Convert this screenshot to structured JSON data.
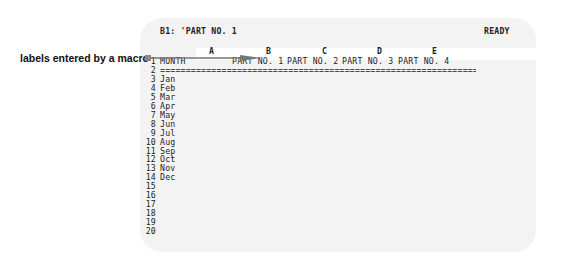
{
  "screen": {
    "cell_address": "B1: 'PART NO. 1",
    "mode_indicator": "READY"
  },
  "columns": [
    "A",
    "B",
    "C",
    "D",
    "E"
  ],
  "rows": [
    {
      "num": "1",
      "A": "MONTH",
      "B": "PART NO. 1",
      "C": "PART NO. 2",
      "D": "PART NO. 3",
      "E": "PART NO. 4"
    },
    {
      "num": "2",
      "A": "==========================================================================="
    },
    {
      "num": "3",
      "A": "Jan"
    },
    {
      "num": "4",
      "A": "Feb"
    },
    {
      "num": "5",
      "A": "Mar"
    },
    {
      "num": "6",
      "A": "Apr"
    },
    {
      "num": "7",
      "A": "May"
    },
    {
      "num": "8",
      "A": "Jun"
    },
    {
      "num": "9",
      "A": "Jul"
    },
    {
      "num": "10",
      "A": "Aug"
    },
    {
      "num": "11",
      "A": "Sep"
    },
    {
      "num": "12",
      "A": "Oct"
    },
    {
      "num": "13",
      "A": "Nov"
    },
    {
      "num": "14",
      "A": "Dec"
    },
    {
      "num": "15"
    },
    {
      "num": "16"
    },
    {
      "num": "17"
    },
    {
      "num": "18"
    },
    {
      "num": "19"
    },
    {
      "num": "20"
    }
  ],
  "annotation": {
    "label": "labels entered by a macro"
  }
}
